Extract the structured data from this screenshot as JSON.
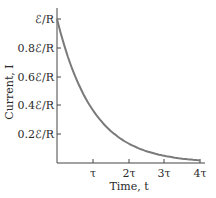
{
  "chart_data": {
    "type": "line",
    "title": "",
    "xlabel": "Time, t",
    "ylabel": "Current, I",
    "x_ticks": [
      "τ",
      "2τ",
      "3τ",
      "4τ"
    ],
    "y_ticks": [
      "0.2ℰ/R",
      "0.4ℰ/R",
      "0.6ℰ/R",
      "0.8ℰ/R",
      "ℰ/R"
    ],
    "xlim": [
      0,
      4
    ],
    "ylim": [
      0,
      1
    ],
    "x_units": "τ",
    "y_units": "ℰ/R",
    "grid": false,
    "legend": null,
    "series": [
      {
        "name": "I(t) = (ℰ/R) e^(-t/τ)",
        "color": "#7a7a7a",
        "x": [
          0,
          0.25,
          0.5,
          0.75,
          1,
          1.5,
          2,
          2.5,
          3,
          3.5,
          4
        ],
        "values": [
          1.0,
          0.78,
          0.61,
          0.47,
          0.37,
          0.22,
          0.14,
          0.08,
          0.05,
          0.03,
          0.02
        ]
      }
    ]
  },
  "labels": {
    "xlabel": "Time, t",
    "ylabel": "Current, I",
    "x_ticks": [
      "τ",
      "2τ",
      "3τ",
      "4τ"
    ],
    "y_ticks": [
      "ℰ/R",
      "0.8ℰ/R",
      "0.6ℰ/R",
      "0.4ℰ/R",
      "0.2ℰ/R"
    ]
  }
}
